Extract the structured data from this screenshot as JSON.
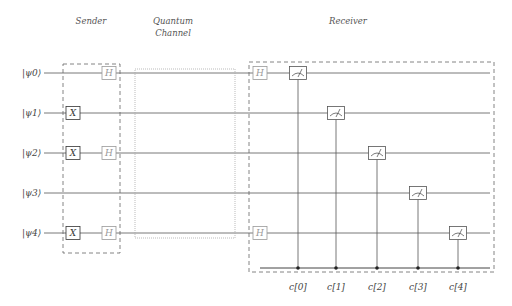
{
  "sections": {
    "sender": "Sender",
    "channel_line1": "Quantum",
    "channel_line2": "Channel",
    "receiver": "Receiver"
  },
  "qubits": [
    {
      "label": "|ψ0⟩",
      "y": 73
    },
    {
      "label": "|ψ1⟩",
      "y": 113
    },
    {
      "label": "|ψ2⟩",
      "y": 153
    },
    {
      "label": "|ψ3⟩",
      "y": 193
    },
    {
      "label": "|ψ4⟩",
      "y": 233
    }
  ],
  "sender_gates": [
    {
      "qubit": 0,
      "gate": "H",
      "x": 109
    },
    {
      "qubit": 1,
      "gate": "X",
      "x": 73
    },
    {
      "qubit": 2,
      "gate": "X",
      "x": 73
    },
    {
      "qubit": 2,
      "gate": "H",
      "x": 109
    },
    {
      "qubit": 4,
      "gate": "X",
      "x": 73
    },
    {
      "qubit": 4,
      "gate": "H",
      "x": 109
    }
  ],
  "receiver_gates": [
    {
      "qubit": 0,
      "gate": "H",
      "x": 260
    },
    {
      "qubit": 4,
      "gate": "H",
      "x": 260
    }
  ],
  "measurements": [
    {
      "qubit": 0,
      "x": 298,
      "classical": "c[0]"
    },
    {
      "qubit": 1,
      "x": 336,
      "classical": "c[1]"
    },
    {
      "qubit": 2,
      "x": 377,
      "classical": "c[2]"
    },
    {
      "qubit": 3,
      "x": 418,
      "classical": "c[3]"
    },
    {
      "qubit": 4,
      "x": 458,
      "classical": "c[4]"
    }
  ],
  "colors": {
    "wire": "#555555",
    "gate_x": "#333333",
    "gate_h": "#999999",
    "dashed_box": "#666666",
    "dotted_box": "#aaaaaa"
  }
}
